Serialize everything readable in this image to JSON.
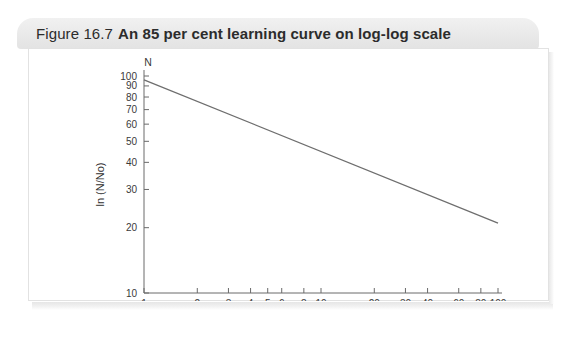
{
  "caption": {
    "figure_number": "Figure 16.7",
    "title": "An 85 per cent learning curve on log-log scale"
  },
  "chart_data": {
    "type": "line",
    "title": "An 85 per cent learning curve on log-log scale",
    "xlabel": "Cumulative units produced",
    "ylabel": "ln (N/No)",
    "y_axis_top_symbol": "N",
    "xscale": "log",
    "yscale": "log",
    "xlim": [
      1,
      100
    ],
    "ylim": [
      10,
      100
    ],
    "grid": false,
    "legend": null,
    "x_ticks": [
      1,
      2,
      3,
      4,
      5,
      6,
      8,
      10,
      20,
      30,
      40,
      60,
      80,
      100
    ],
    "x_tick_labels": [
      "1",
      "2",
      "3",
      "4",
      "5",
      "6",
      "8",
      "10",
      "20",
      "30",
      "40",
      "60",
      "80",
      "100"
    ],
    "y_ticks": [
      10,
      20,
      30,
      40,
      50,
      60,
      70,
      80,
      90,
      100
    ],
    "y_tick_labels": [
      "10",
      "20",
      "30",
      "40",
      "50",
      "60",
      "70",
      "80",
      "90",
      "100"
    ],
    "series": [
      {
        "name": "85 per cent learning curve",
        "color": "#6e6e6e",
        "x": [
          1,
          2,
          4,
          8,
          16,
          32,
          64,
          100
        ],
        "y": [
          96,
          81.6,
          69.4,
          59,
          50.1,
          42.6,
          36.2,
          32.1
        ],
        "endpoints": {
          "start": [
            1,
            96
          ],
          "end": [
            100,
            21
          ]
        }
      }
    ]
  }
}
